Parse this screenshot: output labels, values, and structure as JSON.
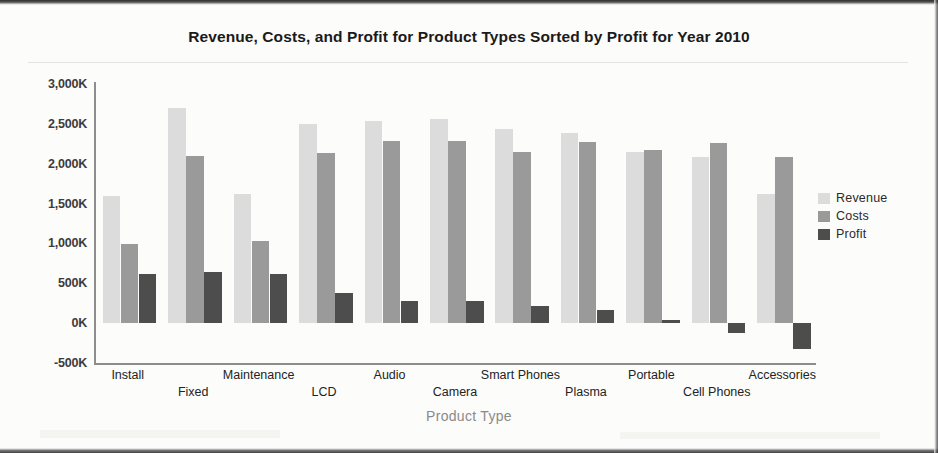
{
  "chart_data": {
    "type": "bar",
    "title": "Revenue, Costs, and Profit for Product Types Sorted by Profit for Year 2010",
    "xlabel": "Product Type",
    "ylabel": "",
    "ylim": [
      -500000,
      3000000
    ],
    "grid": false,
    "legend_position": "right",
    "ytick_labels": [
      "3,000K",
      "2,500K",
      "2,000K",
      "1,500K",
      "1,000K",
      "500K",
      "0K",
      "-500K"
    ],
    "ytick_values": [
      3000000,
      2500000,
      2000000,
      1500000,
      1000000,
      500000,
      0,
      -500000
    ],
    "categories": [
      "Install",
      "Fixed",
      "Maintenance",
      "LCD",
      "Audio",
      "Camera",
      "Smart Phones",
      "Plasma",
      "Portable",
      "Cell Phones",
      "Accessories"
    ],
    "series": [
      {
        "name": "Revenue",
        "color": "#dcdcdc",
        "values": [
          1600000,
          2700000,
          1620000,
          2500000,
          2540000,
          2560000,
          2440000,
          2380000,
          2150000,
          2090000,
          1620000
        ]
      },
      {
        "name": "Costs",
        "color": "#9a9a9a",
        "values": [
          990000,
          2100000,
          1030000,
          2140000,
          2280000,
          2290000,
          2150000,
          2270000,
          2170000,
          2260000,
          2090000
        ]
      },
      {
        "name": "Profit",
        "color": "#4d4d4d",
        "values": [
          620000,
          640000,
          620000,
          380000,
          280000,
          280000,
          215000,
          160000,
          40000,
          -120000,
          -330000
        ]
      }
    ]
  },
  "legend": {
    "items": [
      {
        "label": "Revenue"
      },
      {
        "label": "Costs"
      },
      {
        "label": "Profit"
      }
    ]
  }
}
